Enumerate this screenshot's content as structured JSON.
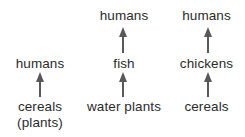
{
  "diagram": {
    "type": "food-chain-diagram",
    "background_color": "#ffffff",
    "text_color": "#2b2b2b",
    "arrow_color": "#59595b",
    "chains": [
      {
        "id": "chain-cereals-humans",
        "nodes": [
          {
            "label": "cereals",
            "sublabel": "(plants)",
            "level": "bottom"
          },
          {
            "label": "humans",
            "sublabel": "",
            "level": "top"
          }
        ],
        "arrows": [
          {
            "from": "cereals (plants)",
            "to": "humans",
            "direction": "up"
          }
        ]
      },
      {
        "id": "chain-water-plants-fish-humans",
        "nodes": [
          {
            "label": "water plants",
            "sublabel": "",
            "level": "bottom"
          },
          {
            "label": "fish",
            "sublabel": "",
            "level": "middle"
          },
          {
            "label": "humans",
            "sublabel": "",
            "level": "top"
          }
        ],
        "arrows": [
          {
            "from": "water plants",
            "to": "fish",
            "direction": "up"
          },
          {
            "from": "fish",
            "to": "humans",
            "direction": "up"
          }
        ]
      },
      {
        "id": "chain-cereals-chickens-humans",
        "nodes": [
          {
            "label": "cereals",
            "sublabel": "",
            "level": "bottom"
          },
          {
            "label": "chickens",
            "sublabel": "",
            "level": "middle"
          },
          {
            "label": "humans",
            "sublabel": "",
            "level": "top"
          }
        ],
        "arrows": [
          {
            "from": "cereals",
            "to": "chickens",
            "direction": "up"
          },
          {
            "from": "chickens",
            "to": "humans",
            "direction": "up"
          }
        ]
      }
    ]
  }
}
